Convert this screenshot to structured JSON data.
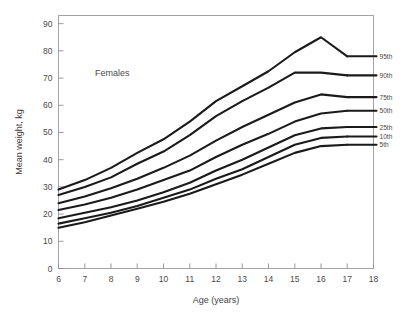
{
  "chart_data": {
    "type": "line",
    "title": "",
    "annotation": "Females",
    "xlabel": "Age (years)",
    "ylabel": "Mean weight, kg",
    "xlim": [
      6,
      18
    ],
    "ylim": [
      0,
      93
    ],
    "xticks": [
      6,
      7,
      8,
      9,
      10,
      11,
      12,
      13,
      14,
      15,
      16,
      17,
      18
    ],
    "yticks": [
      0,
      10,
      20,
      30,
      40,
      50,
      60,
      70,
      80,
      90
    ],
    "xtick_labels": [
      "6",
      "7",
      "8",
      "9",
      "10",
      "11",
      "12",
      "13",
      "14",
      "15",
      "16",
      "17",
      "18"
    ],
    "ytick_labels": [
      "0",
      "10",
      "20",
      "30",
      "40",
      "50",
      "60",
      "70",
      "80",
      "90"
    ],
    "grid": false,
    "legend_position": "right-inline-labels",
    "x": [
      6,
      7,
      8,
      9,
      10,
      11,
      12,
      13,
      14,
      15,
      16,
      17
    ],
    "series": [
      {
        "name": "95th",
        "label": "95th",
        "values": [
          29.0,
          32.5,
          37.0,
          42.5,
          47.5,
          54.0,
          61.5,
          67.0,
          72.5,
          79.5,
          85.0,
          78.0
        ]
      },
      {
        "name": "90th",
        "label": "90th",
        "values": [
          27.0,
          30.0,
          33.5,
          38.5,
          43.0,
          49.0,
          56.0,
          61.5,
          66.5,
          72.0,
          72.0,
          71.0
        ]
      },
      {
        "name": "75th",
        "label": "75th",
        "values": [
          24.0,
          26.5,
          29.5,
          33.0,
          37.0,
          41.5,
          47.0,
          52.0,
          56.5,
          61.0,
          64.0,
          63.0
        ]
      },
      {
        "name": "50th",
        "label": "50th",
        "values": [
          21.5,
          23.5,
          26.0,
          29.0,
          32.5,
          36.0,
          41.0,
          45.5,
          49.5,
          54.0,
          57.0,
          58.0
        ]
      },
      {
        "name": "25th",
        "label": "25th",
        "values": [
          18.5,
          20.5,
          22.5,
          25.0,
          28.0,
          31.5,
          36.0,
          40.0,
          44.5,
          49.0,
          51.5,
          52.0
        ]
      },
      {
        "name": "10th",
        "label": "10th",
        "values": [
          16.5,
          18.5,
          20.5,
          23.0,
          26.0,
          29.0,
          33.0,
          36.5,
          41.0,
          45.5,
          48.0,
          48.5
        ]
      },
      {
        "name": "5th",
        "label": "5th",
        "values": [
          15.0,
          17.0,
          19.5,
          22.0,
          24.5,
          27.5,
          31.0,
          34.5,
          38.5,
          42.5,
          45.0,
          45.5
        ]
      }
    ]
  },
  "figure": {
    "annotation_label": "Females",
    "x_axis_title": "Age (years)",
    "y_axis_title": "Mean weight, kg"
  }
}
